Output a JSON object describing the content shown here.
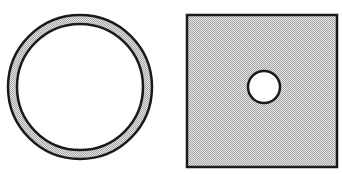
{
  "diagram": {
    "figures": [
      {
        "id": "ring",
        "shape": "annulus",
        "center": [
          80,
          87
        ],
        "outer_radius": 72,
        "inner_radius": 63,
        "fill": "stippled-gray",
        "stroke": "#1a1a1a"
      },
      {
        "id": "square-with-hole",
        "shape": "square",
        "x": 187,
        "y": 15,
        "width": 150,
        "height": 152,
        "fill": "stippled-gray",
        "stroke": "#1a1a1a",
        "hole": {
          "shape": "circle",
          "center": [
            264,
            87
          ],
          "radius": 16,
          "fill": "#ffffff"
        }
      }
    ],
    "colors": {
      "stroke": "#1a1a1a",
      "fill_light": "#d9d9d9",
      "fill_dark": "#a6a6a6",
      "background": "#ffffff"
    }
  }
}
